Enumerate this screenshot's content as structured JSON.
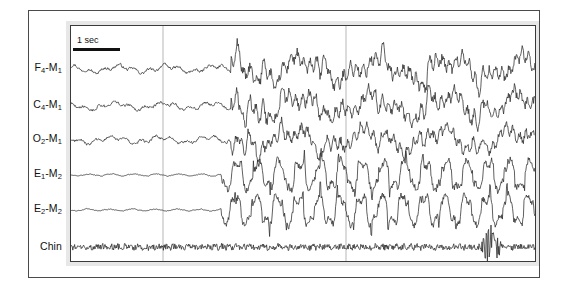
{
  "figure": {
    "kind": "polysomnography-epoch",
    "background_color": "#ffffff",
    "frame_color": "#4a4a4a",
    "trace_color": "#2b2b2b",
    "gridline_color": "#9a9a9a",
    "plot_background": "#ffffff"
  },
  "scalebar": {
    "label": "1 sec",
    "length_px": 47
  },
  "channels": [
    {
      "label_html": "F<sub>4</sub>-M<sub>1</sub>",
      "name": "F4-M1",
      "type": "EEG",
      "baseline_y": 43
    },
    {
      "label_html": "C<sub>4</sub>-M<sub>1</sub>",
      "name": "C4-M1",
      "type": "EEG",
      "baseline_y": 80
    },
    {
      "label_html": "O<sub>2</sub>-M<sub>1</sub>",
      "name": "O2-M1",
      "type": "EEG",
      "baseline_y": 114
    },
    {
      "label_html": "E<sub>1</sub>-M<sub>2</sub>",
      "name": "E1-M2",
      "type": "EOG",
      "baseline_y": 149
    },
    {
      "label_html": "E<sub>2</sub>-M<sub>2</sub>",
      "name": "E2-M2",
      "type": "EOG",
      "baseline_y": 184
    },
    {
      "label_html": "Chin",
      "name": "Chin",
      "type": "EMG",
      "baseline_y": 221
    }
  ],
  "label_positions_px": [
    68,
    105,
    139,
    174,
    209,
    246
  ],
  "gridlines_x": [
    92,
    275
  ],
  "chart_data": {
    "type": "line",
    "title": "",
    "xlabel": "",
    "ylabel": "",
    "grid": true,
    "legend": "none",
    "x_units": "seconds",
    "sampling_note": "waveform rendered as polyline traces",
    "seconds_per_gridline": 4,
    "xlim": [
      0,
      10.2
    ],
    "series": [
      {
        "name": "F4-M1",
        "type": "EEG",
        "baseline_y": 43,
        "segments": [
          {
            "phase": "low-amplitude-mixed-frequency",
            "x_start": 0,
            "x_end": 160,
            "amplitude": 4,
            "freq": 0.55
          },
          {
            "phase": "high-amplitude-slow-wave-burst",
            "x_start": 160,
            "x_end": 464,
            "amplitude": 15,
            "freq": 0.9
          }
        ]
      },
      {
        "name": "C4-M1",
        "type": "EEG",
        "baseline_y": 80,
        "segments": [
          {
            "phase": "low-amplitude-mixed-frequency",
            "x_start": 0,
            "x_end": 160,
            "amplitude": 4,
            "freq": 0.55
          },
          {
            "phase": "high-amplitude-slow-wave-burst",
            "x_start": 160,
            "x_end": 464,
            "amplitude": 15,
            "freq": 0.9
          }
        ]
      },
      {
        "name": "O2-M1",
        "type": "EEG",
        "baseline_y": 114,
        "segments": [
          {
            "phase": "low-amplitude-mixed-frequency",
            "x_start": 0,
            "x_end": 160,
            "amplitude": 4,
            "freq": 0.6
          },
          {
            "phase": "high-amplitude-slow-wave-burst",
            "x_start": 160,
            "x_end": 464,
            "amplitude": 13,
            "freq": 0.95
          }
        ]
      },
      {
        "name": "E1-M2",
        "type": "EOG",
        "baseline_y": 149,
        "segments": [
          {
            "phase": "quiescent",
            "x_start": 0,
            "x_end": 150,
            "amplitude": 2,
            "freq": 0.4
          },
          {
            "phase": "rapid-eye-movement-bursts",
            "x_start": 150,
            "x_end": 464,
            "amplitude": 14,
            "freq": 1.4
          }
        ]
      },
      {
        "name": "E2-M2",
        "type": "EOG",
        "baseline_y": 184,
        "segments": [
          {
            "phase": "quiescent",
            "x_start": 0,
            "x_end": 150,
            "amplitude": 2,
            "freq": 0.4
          },
          {
            "phase": "rapid-eye-movement-bursts",
            "x_start": 150,
            "x_end": 464,
            "amplitude": 14,
            "freq": 1.4
          }
        ]
      },
      {
        "name": "Chin",
        "type": "EMG",
        "baseline_y": 221,
        "segments": [
          {
            "phase": "low-tonic-emg",
            "x_start": 0,
            "x_end": 410,
            "amplitude": 3,
            "freq": 6
          },
          {
            "phase": "phasic-emg-burst",
            "x_start": 410,
            "x_end": 430,
            "amplitude": 11,
            "freq": 8
          },
          {
            "phase": "low-tonic-emg",
            "x_start": 430,
            "x_end": 464,
            "amplitude": 3,
            "freq": 6
          }
        ]
      }
    ]
  }
}
